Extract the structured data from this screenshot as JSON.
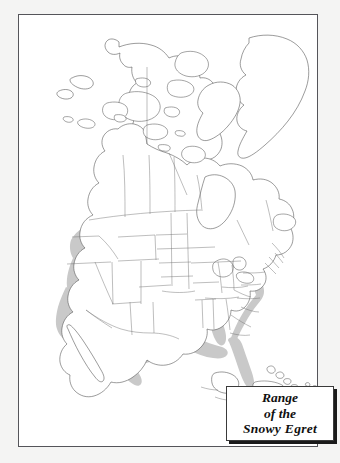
{
  "figure": {
    "kind": "range-map",
    "subject": "Snowy Egret",
    "region_depicted": "North America",
    "background_color": "#f4f4f3",
    "frame_color": "#55555a",
    "map_fill_color": "#ffffff",
    "coastline_color": "#4a4a4a",
    "border_line_color": "#6d6d6d",
    "range_shade_color": "#c9c9c9"
  },
  "legend": {
    "line1": "Range",
    "line2": "of the",
    "line3": "Snowy Egret",
    "border_color": "#3a3a3a",
    "shadow_color": "#1a1a1a",
    "background_color": "#ffffff"
  },
  "map": {
    "landmasses": [
      "North America mainland",
      "Alaska",
      "Greenland",
      "Canadian Arctic Archipelago",
      "Baffin Island",
      "Newfoundland",
      "Cuba",
      "Bahamas",
      "Hispaniola",
      "Baja California",
      "Yucatan Peninsula",
      "Central America"
    ],
    "features": [
      "Hudson Bay",
      "Great Lakes",
      "Gulf of Mexico",
      "Gulf of California",
      "US state boundaries",
      "Canadian province boundaries",
      "Mexico national boundary"
    ],
    "range_areas": [
      "Western United States interior: Oregon, Idaho, Nevada, Utah, California, Arizona, New Mexico, Colorado",
      "Pacific coast of Baja California and mainland Mexico",
      "Gulf coast of Texas and northeastern Mexico",
      "Lower Mississippi valley: Louisiana, Mississippi, Arkansas, Alabama",
      "Florida peninsula",
      "Atlantic coastal strip from Chesapeake Bay to Georgia"
    ]
  }
}
